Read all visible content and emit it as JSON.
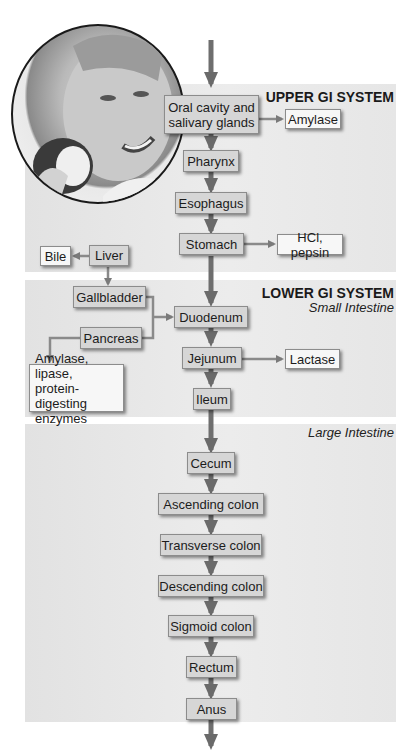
{
  "sections": {
    "upper": {
      "title": "UPPER GI SYSTEM"
    },
    "lower": {
      "title": "LOWER GI SYSTEM",
      "subtitle": "Small Intestine"
    },
    "large": {
      "subtitle": "Large Intestine"
    }
  },
  "organs": {
    "oral": "Oral cavity and salivary glands",
    "oral_line1": "Oral cavity and",
    "oral_line2": "salivary glands",
    "pharynx": "Pharynx",
    "esophagus": "Esophagus",
    "stomach": "Stomach",
    "liver": "Liver",
    "gallbladder": "Gallbladder",
    "pancreas": "Pancreas",
    "duodenum": "Duodenum",
    "jejunum": "Jejunum",
    "ileum": "Ileum",
    "cecum": "Cecum",
    "ascending": "Ascending colon",
    "transverse": "Transverse colon",
    "descending": "Descending colon",
    "sigmoid": "Sigmoid colon",
    "rectum": "Rectum",
    "anus": "Anus"
  },
  "secretions": {
    "amylase": "Amylase",
    "hcl": "HCl, pepsin",
    "bile": "Bile",
    "lactase": "Lactase",
    "pancreatic_line1": "Amylase, lipase,",
    "pancreatic_line2": "protein-digesting",
    "pancreatic_line3": "enzymes"
  },
  "photo": {
    "description": "Smiling boy biting an apple"
  },
  "colors": {
    "panel": "#e6e6e6",
    "box": "#d6d6d6",
    "arrow": "#6e6e6e",
    "secretion_box": "#f7f7f7"
  }
}
